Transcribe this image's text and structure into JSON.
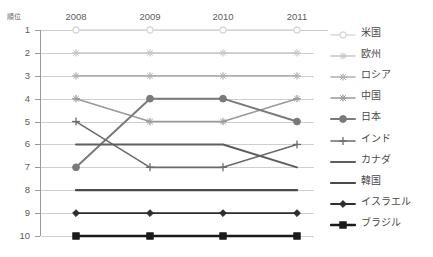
{
  "chart_data": {
    "type": "line",
    "title": "",
    "xlabel": "",
    "ylabel": "順位",
    "categories": [
      "2008",
      "2009",
      "2010",
      "2011"
    ],
    "ylim": [
      1,
      10
    ],
    "y_ticks": [
      "1",
      "2",
      "3",
      "4",
      "5",
      "6",
      "7",
      "8",
      "9",
      "10"
    ],
    "y_axis_inverted": true,
    "grid": "horizontal",
    "legend_position": "right",
    "series": [
      {
        "name": "米国",
        "values": [
          1,
          1,
          1,
          1
        ],
        "color": "#d9d9d9",
        "marker": "circle-open",
        "width": 1.4
      },
      {
        "name": "欧州",
        "values": [
          2,
          2,
          2,
          2
        ],
        "color": "#c6c6c6",
        "marker": "asterisk",
        "width": 1.4
      },
      {
        "name": "ロシア",
        "values": [
          3,
          3,
          3,
          3
        ],
        "color": "#b0b0b0",
        "marker": "asterisk",
        "width": 1.4
      },
      {
        "name": "中国",
        "values": [
          4,
          5,
          5,
          4
        ],
        "color": "#9a9a9a",
        "marker": "asterisk",
        "width": 1.6
      },
      {
        "name": "日本",
        "values": [
          7,
          4,
          4,
          5
        ],
        "color": "#7a7a7a",
        "marker": "circle-fill",
        "width": 2.0
      },
      {
        "name": "インド",
        "values": [
          5,
          7,
          7,
          6
        ],
        "color": "#6b6b6b",
        "marker": "plus",
        "width": 1.6
      },
      {
        "name": "カナダ",
        "values": [
          6,
          6,
          6,
          7
        ],
        "color": "#5e5e5e",
        "marker": "none",
        "width": 2.0
      },
      {
        "name": "韓国",
        "values": [
          8,
          8,
          8,
          8
        ],
        "color": "#4a4a4a",
        "marker": "none",
        "width": 2.2
      },
      {
        "name": "イスラエル",
        "values": [
          9,
          9,
          9,
          9
        ],
        "color": "#2e2e2e",
        "marker": "diamond",
        "width": 1.8
      },
      {
        "name": "ブラジル",
        "values": [
          10,
          10,
          10,
          10
        ],
        "color": "#1a1a1a",
        "marker": "square",
        "width": 2.4
      }
    ]
  },
  "axes": {
    "y_title": "順位"
  }
}
